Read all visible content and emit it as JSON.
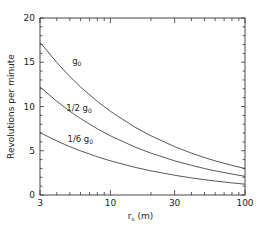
{
  "chart_data": {
    "type": "line",
    "title": "",
    "xlabel": "r_s (m)",
    "xlabel_main": "r",
    "xlabel_sub": "s",
    "xlabel_unit": " (m)",
    "ylabel": "Revolutions per minute",
    "xscale": "log",
    "xlim": [
      3,
      100
    ],
    "ylim": [
      0,
      20
    ],
    "grid": false,
    "legend": "inline labels",
    "x_ticks": [
      3,
      10,
      30,
      100
    ],
    "x_tick_labels": [
      "3",
      "10",
      "30",
      "100"
    ],
    "y_ticks": [
      0,
      5,
      10,
      15,
      20
    ],
    "y_tick_labels": [
      "0",
      "5",
      "10",
      "15",
      "20"
    ],
    "x": [
      3,
      4,
      5,
      6,
      8,
      10,
      15,
      20,
      30,
      40,
      50,
      60,
      80,
      100
    ],
    "series": [
      {
        "name": "g0",
        "label_main": "g",
        "label_sub": "0",
        "label_prefix": "",
        "values": [
          17.27,
          14.96,
          13.38,
          12.21,
          10.58,
          9.46,
          7.72,
          6.69,
          5.46,
          4.73,
          4.23,
          3.86,
          3.35,
          2.99
        ]
      },
      {
        "name": "1/2 g0",
        "label_main": "g",
        "label_sub": "0",
        "label_prefix": "1/2 ",
        "values": [
          12.21,
          10.58,
          9.46,
          8.64,
          7.48,
          6.69,
          5.46,
          4.73,
          3.86,
          3.35,
          2.99,
          2.73,
          2.37,
          2.11
        ]
      },
      {
        "name": "1/6 g0",
        "label_main": "g",
        "label_sub": "0",
        "label_prefix": "1/6 ",
        "values": [
          7.05,
          6.11,
          5.46,
          4.99,
          4.32,
          3.86,
          3.15,
          2.73,
          2.23,
          1.93,
          1.73,
          1.58,
          1.37,
          1.22
        ]
      }
    ],
    "annotations": [
      {
        "text": "g0",
        "x": 5.2,
        "y": 14.8
      },
      {
        "text": "1/2 g0",
        "x": 4.7,
        "y": 9.5
      },
      {
        "text": "1/6 g0",
        "x": 4.8,
        "y": 6.0
      }
    ]
  }
}
